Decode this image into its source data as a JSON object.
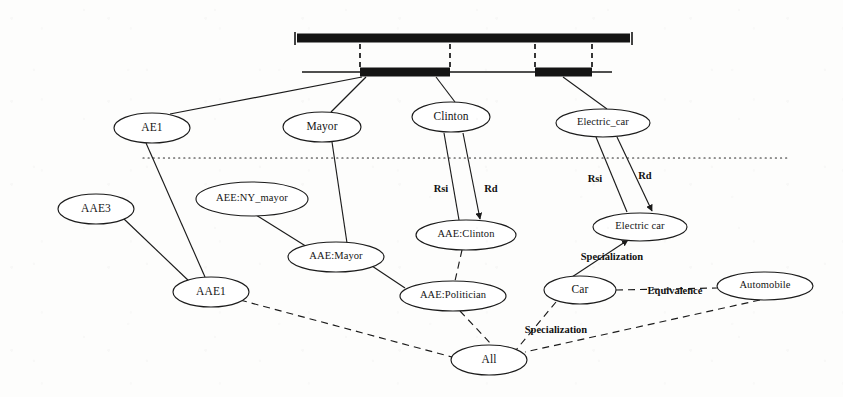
{
  "diagram": {
    "colors": {
      "ink": "#1b1b1b",
      "paper": "#fdfdfc"
    },
    "timeline": {
      "upper_bar_name": "upper-timeline-bar",
      "lower_bar_name": "lower-timeline-bar"
    },
    "nodes": [
      {
        "id": "ae1",
        "label": "AE1",
        "cx": 152,
        "cy": 128,
        "rx": 38,
        "ry": 15
      },
      {
        "id": "mayor",
        "label": "Mayor",
        "cx": 322,
        "cy": 127,
        "rx": 39,
        "ry": 15
      },
      {
        "id": "clinton",
        "label": "Clinton",
        "cx": 451,
        "cy": 117,
        "rx": 39,
        "ry": 15
      },
      {
        "id": "electric_car",
        "label": "Electric_car",
        "cx": 603,
        "cy": 123,
        "rx": 47,
        "ry": 14
      },
      {
        "id": "aae3",
        "label": "AAE3",
        "cx": 96,
        "cy": 209,
        "rx": 38,
        "ry": 15
      },
      {
        "id": "aee_ny_mayor",
        "label": "AEE:NY_mayor",
        "cx": 252,
        "cy": 199,
        "rx": 56,
        "ry": 17
      },
      {
        "id": "aae_mayor",
        "label": "AAE:Mayor",
        "cx": 336,
        "cy": 257,
        "rx": 48,
        "ry": 15
      },
      {
        "id": "aae_clinton",
        "label": "AAE:Clinton",
        "cx": 466,
        "cy": 235,
        "rx": 50,
        "ry": 15
      },
      {
        "id": "electric_car_2",
        "label": "Electric car",
        "cx": 640,
        "cy": 227,
        "rx": 47,
        "ry": 14
      },
      {
        "id": "aae1",
        "label": "AAE1",
        "cx": 211,
        "cy": 292,
        "rx": 38,
        "ry": 15
      },
      {
        "id": "aae_politician",
        "label": "AAE:Politician",
        "cx": 453,
        "cy": 296,
        "rx": 53,
        "ry": 15
      },
      {
        "id": "car",
        "label": "Car",
        "cx": 580,
        "cy": 290,
        "rx": 36,
        "ry": 14
      },
      {
        "id": "automobile",
        "label": "Automobile",
        "cx": 765,
        "cy": 286,
        "rx": 48,
        "ry": 14
      },
      {
        "id": "all",
        "label": "All",
        "cx": 489,
        "cy": 360,
        "rx": 38,
        "ry": 15
      }
    ],
    "edge_labels": [
      {
        "id": "rsi_clinton",
        "label": "Rsi",
        "x": 441,
        "y": 190
      },
      {
        "id": "rd_clinton",
        "label": "Rd",
        "x": 491,
        "y": 190
      },
      {
        "id": "rsi_electric",
        "label": "Rsi",
        "x": 595,
        "y": 180
      },
      {
        "id": "rd_electric",
        "label": "Rd",
        "x": 645,
        "y": 177
      },
      {
        "id": "specialization_1",
        "label": "Specialization",
        "x": 612,
        "y": 258
      },
      {
        "id": "equivalence",
        "label": "Equivalence",
        "x": 675,
        "y": 292
      },
      {
        "id": "specialization_2",
        "label": "Specialization",
        "x": 556,
        "y": 331
      }
    ]
  }
}
